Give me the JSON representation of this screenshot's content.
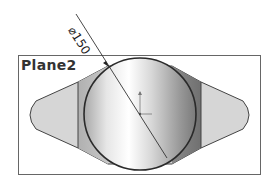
{
  "view": {
    "plane_label": "Plane2",
    "dimension": {
      "symbol": "⌀",
      "value": "150",
      "text": "⌀150"
    }
  },
  "colors": {
    "frame": "#555555",
    "outline": "#333333",
    "lobe_fill": "#d9d9d9",
    "band_fill": "#9a9a9a",
    "circle_light": "#f4f4f4",
    "circle_dark": "#8c8c8c",
    "axis": "#666666"
  }
}
